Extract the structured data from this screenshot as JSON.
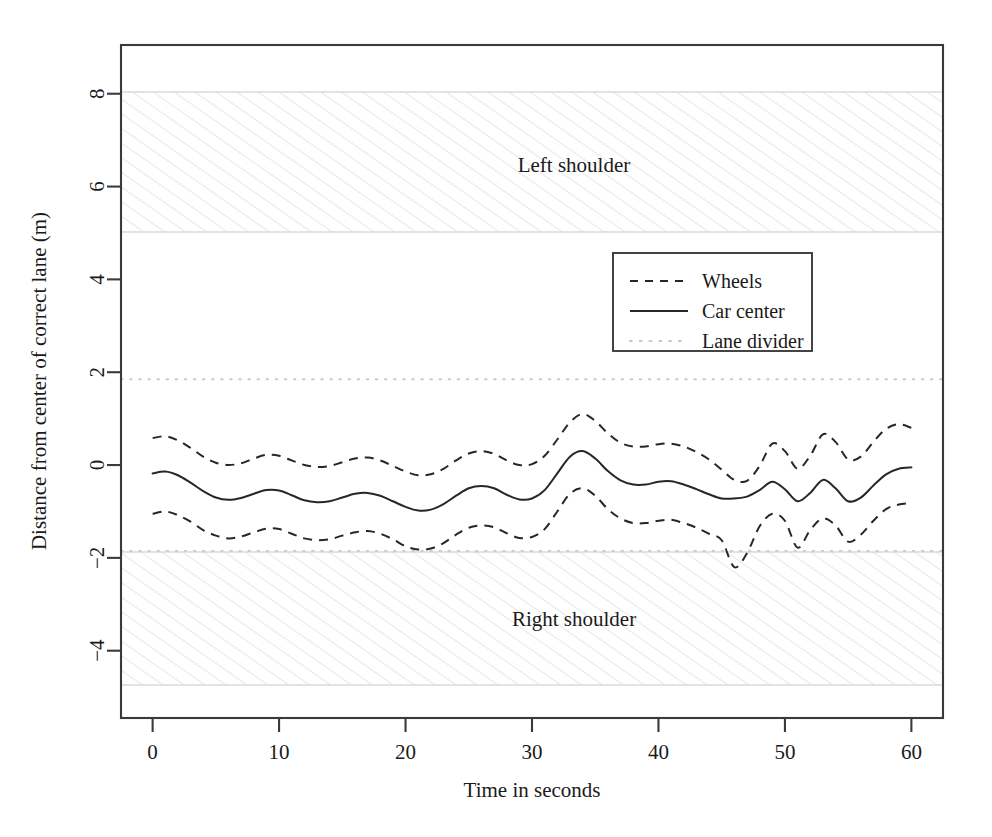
{
  "chart_data": {
    "type": "line",
    "title": "",
    "xlabel": "Time in seconds",
    "ylabel": "Distance from center of correct lane (m)",
    "xlim": [
      -2.5,
      62.5
    ],
    "ylim": [
      -5.45,
      9.05
    ],
    "xticks": [
      0,
      10,
      20,
      30,
      40,
      50,
      60
    ],
    "xtick_labels": [
      "0",
      "10",
      "20",
      "30",
      "40",
      "50",
      "60"
    ],
    "yticks": [
      -4,
      -2,
      0,
      2,
      4,
      6,
      8
    ],
    "ytick_labels": [
      "−4",
      "−2",
      "0",
      "2",
      "4",
      "6",
      "8"
    ],
    "grid": false,
    "legend_position": "upper right inside",
    "legend_entries": [
      {
        "label": "Wheels",
        "style": "dashed"
      },
      {
        "label": "Car center",
        "style": "solid"
      },
      {
        "label": "Lane divider",
        "style": "dotted"
      }
    ],
    "annotations": [
      {
        "text": "Left shoulder",
        "x": 22.5,
        "y": 6.95
      },
      {
        "text": "Right shoulder",
        "x": 22.5,
        "y": -3.35
      }
    ],
    "regions": [
      {
        "name": "Left shoulder",
        "y_bottom": 5.4,
        "y_top": 8.5,
        "hatch": "diagonal",
        "color": "#e9e9f0"
      },
      {
        "name": "Right shoulder",
        "y_bottom": -4.85,
        "y_top": -1.85,
        "hatch": "diagonal",
        "color": "#e9e9f0"
      }
    ],
    "lane_dividers": [
      1.85,
      -1.85
    ],
    "x": [
      0,
      1,
      2,
      3,
      4,
      5,
      6,
      7,
      8,
      9,
      10,
      11,
      12,
      13,
      14,
      15,
      16,
      17,
      18,
      19,
      20,
      21,
      22,
      23,
      24,
      25,
      26,
      27,
      28,
      29,
      30,
      31,
      32,
      33,
      34,
      35,
      36,
      37,
      38,
      39,
      40,
      41,
      42,
      43,
      44,
      45,
      46,
      47,
      48,
      49,
      50,
      51,
      52,
      53,
      54,
      55,
      56,
      57,
      58,
      59,
      60
    ],
    "series": [
      {
        "name": "Wheels",
        "style": "dashed",
        "comment": "upper wheel track = car center + 0.42 m",
        "values": [
          0.58,
          0.62,
          0.53,
          0.37,
          0.18,
          0.05,
          0.0,
          0.04,
          0.14,
          0.22,
          0.2,
          0.1,
          0.0,
          -0.04,
          -0.02,
          0.06,
          0.14,
          0.16,
          0.1,
          -0.02,
          -0.14,
          -0.22,
          -0.2,
          -0.08,
          0.1,
          0.25,
          0.3,
          0.24,
          0.1,
          0.0,
          0.02,
          0.2,
          0.55,
          0.92,
          1.1,
          0.95,
          0.68,
          0.48,
          0.4,
          0.4,
          0.45,
          0.46,
          0.4,
          0.28,
          0.12,
          -0.1,
          -0.32,
          -0.34,
          -0.02,
          0.46,
          0.3,
          -0.08,
          0.2,
          0.66,
          0.5,
          0.12,
          0.18,
          0.5,
          0.78,
          0.88,
          0.8
        ]
      },
      {
        "name": "Car center",
        "style": "solid",
        "values": [
          -0.18,
          -0.14,
          -0.22,
          -0.38,
          -0.56,
          -0.7,
          -0.75,
          -0.71,
          -0.62,
          -0.54,
          -0.55,
          -0.65,
          -0.76,
          -0.8,
          -0.78,
          -0.7,
          -0.62,
          -0.6,
          -0.66,
          -0.78,
          -0.9,
          -0.98,
          -0.96,
          -0.84,
          -0.66,
          -0.5,
          -0.45,
          -0.5,
          -0.64,
          -0.74,
          -0.72,
          -0.54,
          -0.18,
          0.18,
          0.3,
          0.14,
          -0.13,
          -0.33,
          -0.42,
          -0.42,
          -0.36,
          -0.35,
          -0.42,
          -0.52,
          -0.63,
          -0.72,
          -0.72,
          -0.68,
          -0.54,
          -0.36,
          -0.52,
          -0.78,
          -0.6,
          -0.32,
          -0.5,
          -0.78,
          -0.7,
          -0.44,
          -0.2,
          -0.08,
          -0.05
        ]
      },
      {
        "name": "Wheels",
        "style": "dashed",
        "comment": "lower wheel track = car center - 0.82 m",
        "values": [
          -1.05,
          -1.0,
          -1.08,
          -1.22,
          -1.4,
          -1.52,
          -1.58,
          -1.54,
          -1.45,
          -1.37,
          -1.38,
          -1.48,
          -1.58,
          -1.62,
          -1.6,
          -1.52,
          -1.45,
          -1.42,
          -1.48,
          -1.6,
          -1.75,
          -1.82,
          -1.8,
          -1.68,
          -1.5,
          -1.35,
          -1.3,
          -1.34,
          -1.47,
          -1.57,
          -1.55,
          -1.38,
          -1.0,
          -0.62,
          -0.5,
          -0.66,
          -0.95,
          -1.15,
          -1.25,
          -1.25,
          -1.2,
          -1.18,
          -1.25,
          -1.35,
          -1.48,
          -1.62,
          -2.2,
          -1.9,
          -1.32,
          -1.05,
          -1.2,
          -1.78,
          -1.4,
          -1.15,
          -1.3,
          -1.65,
          -1.5,
          -1.2,
          -0.95,
          -0.85,
          -0.82
        ]
      }
    ]
  }
}
